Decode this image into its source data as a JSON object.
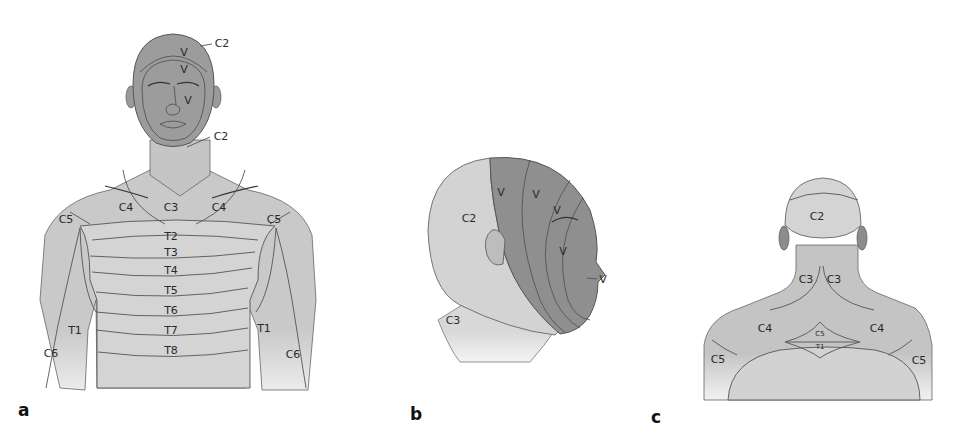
{
  "figure": {
    "colors": {
      "background": "#ffffff",
      "light_skin": "#d2d2d2",
      "mid_skin": "#bdbdbd",
      "dark_trigeminal": "#8f8f8f",
      "line": "#555555"
    },
    "panels": [
      {
        "id": "a",
        "panel_label": "a",
        "view": "anterior",
        "labels": {
          "c2_top": "C2",
          "v_forehead": "V",
          "v_upper": "V",
          "v_mid": "V",
          "c2_chin": "C2",
          "c4_left": "C4",
          "c3_center": "C3",
          "c4_right": "C4",
          "c5_left": "C5",
          "c5_right": "C5",
          "t2": "T2",
          "t3": "T3",
          "t4": "T4",
          "t5": "T5",
          "t6": "T6",
          "t7": "T7",
          "t8": "T8",
          "t1_left": "T1",
          "t1_right": "T1",
          "c6_left": "C6",
          "c6_right": "C6"
        }
      },
      {
        "id": "b",
        "panel_label": "b",
        "view": "lateral head",
        "labels": {
          "c2": "C2",
          "v1": "V",
          "v2": "V",
          "v3": "V",
          "v4": "V",
          "v_lip": "V",
          "c3": "C3"
        }
      },
      {
        "id": "c",
        "panel_label": "c",
        "view": "posterior",
        "labels": {
          "c2": "C2",
          "c3_left": "C3",
          "c3_right": "C3",
          "c4_left": "C4",
          "c4_right": "C4",
          "c5_center": "C5",
          "t1_center": "T1",
          "c5_left": "C5",
          "c5_right": "C5"
        }
      }
    ]
  }
}
